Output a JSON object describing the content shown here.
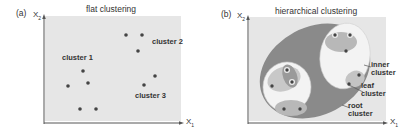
{
  "panel_a": {
    "label": "(a)",
    "title": "flat clustering",
    "y_axis": {
      "label": "X",
      "sub": "2"
    },
    "x_axis": {
      "label": "X",
      "sub": "1"
    },
    "clusters": [
      {
        "name": "cluster 1",
        "points": [
          [
            83,
            70
          ],
          [
            88,
            82
          ],
          [
            68,
            86
          ],
          [
            80,
            109
          ],
          [
            96,
            109
          ]
        ]
      },
      {
        "name": "cluster 2",
        "points": [
          [
            126,
            36
          ],
          [
            142,
            36
          ],
          [
            138,
            52
          ]
        ]
      },
      {
        "name": "cluster 3",
        "points": [
          [
            155,
            76
          ],
          [
            144,
            85
          ]
        ]
      }
    ]
  },
  "panel_b": {
    "label": "(b)",
    "title": "hierarchical clustering",
    "y_axis": {
      "label": "X",
      "sub": "2"
    },
    "x_axis": {
      "label": "X",
      "sub": "1"
    },
    "annotations": {
      "inner": [
        "inner",
        "cluster"
      ],
      "leaf": [
        "leaf",
        "cluster"
      ],
      "root": [
        "root",
        "cluster"
      ]
    }
  },
  "colors": {
    "plot_bg": "#e6e6e6",
    "root": "#8a8a8a",
    "inner": "#f4f4f4",
    "leaf": "#b8b8b8",
    "point": "#444444",
    "axis": "#555555"
  }
}
